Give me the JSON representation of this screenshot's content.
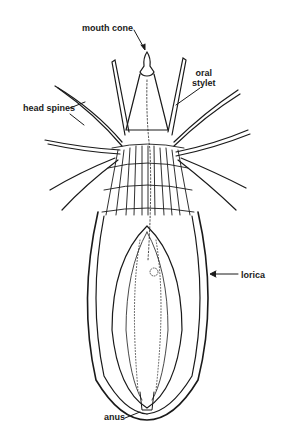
{
  "diagram": {
    "labels": {
      "mouth_cone": "mouth cone",
      "oral_stylet_line1": "oral",
      "oral_stylet_line2": "stylet",
      "head_spines": "head spines",
      "lorica": "lorica",
      "anus": "anus"
    },
    "colors": {
      "ink": "#1a1a1a",
      "background": "#ffffff"
    }
  }
}
